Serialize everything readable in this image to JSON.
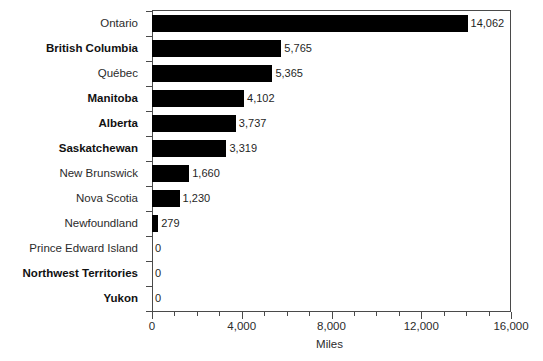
{
  "chart_data": {
    "type": "bar",
    "orientation": "horizontal",
    "title": "",
    "xlabel": "Miles",
    "ylabel": "",
    "xlim": [
      0,
      16000
    ],
    "xticks": [
      "0",
      "4,000",
      "8,000",
      "12,000",
      "16,000"
    ],
    "xtick_values": [
      0,
      4000,
      8000,
      12000,
      16000
    ],
    "minor_tick_interval": 1000,
    "grid": false,
    "legend": false,
    "bar_color": "#000000",
    "axis_color": "#4a4a4a",
    "categories": [
      "Ontario",
      "British Columbia",
      "Québec",
      "Manitoba",
      "Alberta",
      "Saskatchewan",
      "New Brunswick",
      "Nova Scotia",
      "Newfoundland",
      "Prince Edward Island",
      "Northwest Territories",
      "Yukon"
    ],
    "values": [
      14062,
      5765,
      5365,
      4102,
      3737,
      3319,
      1660,
      1230,
      279,
      0,
      0,
      0
    ],
    "value_labels": [
      "14,062",
      "5,765",
      "5,365",
      "4,102",
      "3,737",
      "3,319",
      "1,660",
      "1,230",
      "279",
      "0",
      "0",
      "0"
    ],
    "label_bold": [
      false,
      true,
      false,
      true,
      true,
      true,
      false,
      false,
      false,
      false,
      true,
      true
    ]
  }
}
